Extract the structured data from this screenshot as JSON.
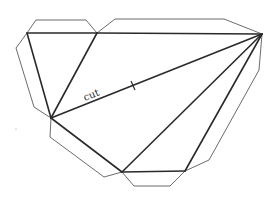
{
  "diagram": {
    "title": "",
    "colors": {
      "fold_line": "#2a2a2a",
      "tab_line": "#5a5a5a",
      "background": "#ffffff"
    },
    "vertices": {
      "A": [
        27,
        33
      ],
      "B": [
        97,
        33
      ],
      "C": [
        262,
        34
      ],
      "D": [
        51,
        118
      ],
      "E": [
        122,
        172
      ],
      "F": [
        185,
        171
      ]
    },
    "fold_edges": [
      [
        "A",
        "B"
      ],
      [
        "B",
        "C"
      ],
      [
        "A",
        "D"
      ],
      [
        "B",
        "D"
      ],
      [
        "D",
        "E"
      ],
      [
        "E",
        "F"
      ],
      [
        "C",
        "E"
      ],
      [
        "C",
        "F"
      ]
    ],
    "cut_edge": [
      "D",
      "C"
    ],
    "cut_label": "cut",
    "tabs": [
      {
        "edge": "A-B",
        "points": "27,33 36,20 86,20 97,33"
      },
      {
        "edge": "B-C",
        "points": "97,33 115,19 224,19 262,34"
      },
      {
        "edge": "A-D",
        "points": "27,33 16,48 34,107 51,118"
      },
      {
        "edge": "D-E",
        "points": "51,118 50,137 104,177 122,172"
      },
      {
        "edge": "E-F",
        "points": "122,172 134,186 170,186 185,171"
      },
      {
        "edge": "F-C",
        "points": "185,171 209,160 259,70 262,34"
      }
    ]
  }
}
